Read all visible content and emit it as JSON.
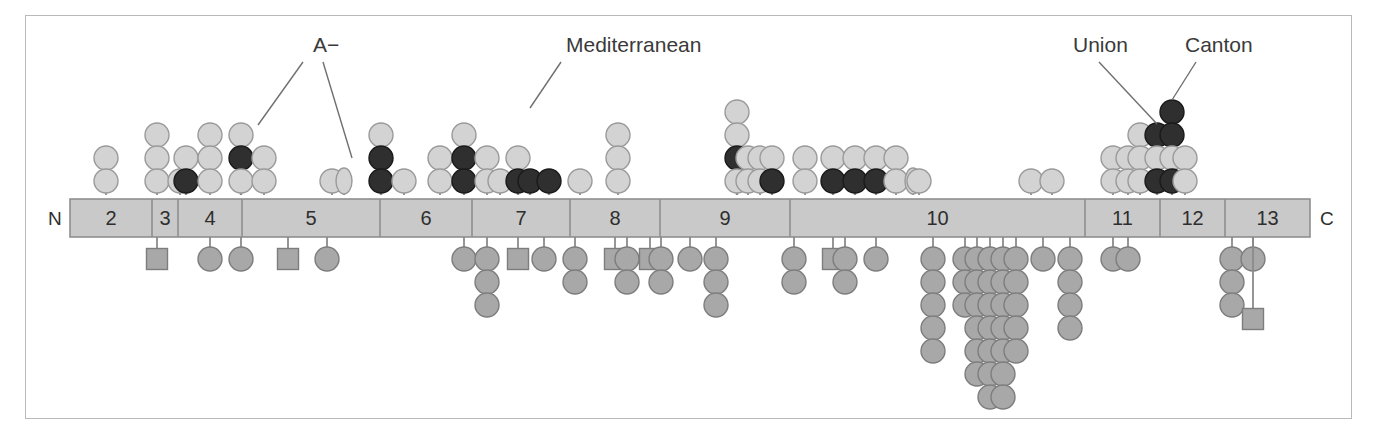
{
  "figure": {
    "terminals": {
      "n_label": "N",
      "c_label": "C"
    },
    "colors": {
      "frame_border": "#b9b9b9",
      "bar_fill": "#c9c9c9",
      "bar_stroke": "#8f8f8f",
      "light_marker_fill": "#d3d3d3",
      "light_marker_stroke": "#9a9a9a",
      "dark_marker_fill": "#2f2f2f",
      "dark_marker_stroke": "#1a1a1a",
      "lower_marker_fill": "#a8a8a8",
      "lower_marker_stroke": "#7d7d7d",
      "stem": "#8b8b8b",
      "text": "#2e2e2e",
      "leader_line": "#6f6f6f"
    },
    "bar": {
      "x": 70,
      "y": 199,
      "width": 1240,
      "height": 38
    },
    "exons": [
      {
        "label": "2",
        "x0": 70,
        "x1": 152
      },
      {
        "label": "3",
        "x0": 152,
        "x1": 178
      },
      {
        "label": "4",
        "x0": 178,
        "x1": 242
      },
      {
        "label": "5",
        "x0": 242,
        "x1": 380
      },
      {
        "label": "6",
        "x0": 380,
        "x1": 472
      },
      {
        "label": "7",
        "x0": 472,
        "x1": 570
      },
      {
        "label": "8",
        "x0": 570,
        "x1": 660
      },
      {
        "label": "9",
        "x0": 660,
        "x1": 790
      },
      {
        "label": "10",
        "x0": 790,
        "x1": 1085
      },
      {
        "label": "11",
        "x0": 1085,
        "x1": 1160
      },
      {
        "label": "12",
        "x0": 1160,
        "x1": 1225
      },
      {
        "label": "13",
        "x0": 1225,
        "x1": 1310
      }
    ],
    "annotations": [
      {
        "name": "A-minus",
        "text": "A−",
        "text_x": 313,
        "text_y": 52,
        "leaders": [
          {
            "x1": 303,
            "y1": 62,
            "x2": 258,
            "y2": 125
          },
          {
            "x1": 323,
            "y1": 62,
            "x2": 352,
            "y2": 158
          }
        ]
      },
      {
        "name": "mediterranean",
        "text": "Mediterranean",
        "text_x": 566,
        "text_y": 52,
        "leaders": [
          {
            "x1": 561,
            "y1": 62,
            "x2": 530,
            "y2": 108
          }
        ]
      },
      {
        "name": "union",
        "text": "Union",
        "text_x": 1073,
        "text_y": 52,
        "leaders": [
          {
            "x1": 1099,
            "y1": 62,
            "x2": 1157,
            "y2": 124
          }
        ]
      },
      {
        "name": "canton",
        "text": "Canton",
        "text_x": 1185,
        "text_y": 52,
        "leaders": [
          {
            "x1": 1196,
            "y1": 62,
            "x2": 1172,
            "y2": 100
          }
        ]
      }
    ],
    "upper_stacks": [
      {
        "x": 106,
        "shape": "circle",
        "colors": [
          "light",
          "light"
        ]
      },
      {
        "x": 157,
        "shape": "circle",
        "colors": [
          "light",
          "light",
          "light"
        ]
      },
      {
        "x": 180,
        "shape": "circle",
        "colors": [
          "light"
        ]
      },
      {
        "x": 186,
        "shape": "circle",
        "colors": [
          "light",
          "dark"
        ]
      },
      {
        "x": 210,
        "shape": "circle",
        "colors": [
          "light",
          "light",
          "light"
        ]
      },
      {
        "x": 241,
        "shape": "circle",
        "colors": [
          "light",
          "dark",
          "light"
        ]
      },
      {
        "x": 264,
        "shape": "circle",
        "colors": [
          "light",
          "light"
        ]
      },
      {
        "x": 332,
        "shape": "circle",
        "colors": [
          "light"
        ]
      },
      {
        "x": 344,
        "shape": "ellipse",
        "colors": [
          "light"
        ]
      },
      {
        "x": 381,
        "shape": "circle",
        "colors": [
          "light",
          "dark",
          "dark"
        ]
      },
      {
        "x": 404,
        "shape": "circle",
        "colors": [
          "light"
        ]
      },
      {
        "x": 440,
        "shape": "circle",
        "colors": [
          "light",
          "light"
        ]
      },
      {
        "x": 464,
        "shape": "circle",
        "colors": [
          "light",
          "dark",
          "dark"
        ]
      },
      {
        "x": 487,
        "shape": "circle",
        "colors": [
          "light",
          "light"
        ]
      },
      {
        "x": 500,
        "shape": "circle",
        "colors": [
          "light"
        ]
      },
      {
        "x": 518,
        "shape": "circle",
        "colors": [
          "light",
          "dark"
        ]
      },
      {
        "x": 530,
        "shape": "circle",
        "colors": [
          "dark"
        ]
      },
      {
        "x": 549,
        "shape": "circle",
        "colors": [
          "dark"
        ]
      },
      {
        "x": 580,
        "shape": "circle",
        "colors": [
          "light"
        ]
      },
      {
        "x": 618,
        "shape": "circle",
        "colors": [
          "light",
          "light",
          "light"
        ]
      },
      {
        "x": 737,
        "shape": "circle",
        "colors": [
          "light",
          "light",
          "dark",
          "light"
        ]
      },
      {
        "x": 748,
        "shape": "circle",
        "colors": [
          "light",
          "light"
        ]
      },
      {
        "x": 760,
        "shape": "circle",
        "colors": [
          "light",
          "light"
        ]
      },
      {
        "x": 772,
        "shape": "circle",
        "colors": [
          "light",
          "dark"
        ]
      },
      {
        "x": 805,
        "shape": "circle",
        "colors": [
          "light",
          "light"
        ]
      },
      {
        "x": 833,
        "shape": "circle",
        "colors": [
          "light",
          "dark"
        ]
      },
      {
        "x": 855,
        "shape": "circle",
        "colors": [
          "light",
          "dark"
        ]
      },
      {
        "x": 876,
        "shape": "circle",
        "colors": [
          "light",
          "dark"
        ]
      },
      {
        "x": 896,
        "shape": "circle",
        "colors": [
          "light",
          "light"
        ]
      },
      {
        "x": 913,
        "shape": "ellipse",
        "colors": [
          "light"
        ]
      },
      {
        "x": 919,
        "shape": "circle",
        "colors": [
          "light"
        ]
      },
      {
        "x": 1031,
        "shape": "circle",
        "colors": [
          "light"
        ]
      },
      {
        "x": 1052,
        "shape": "circle",
        "colors": [
          "light"
        ]
      },
      {
        "x": 1113,
        "shape": "circle",
        "colors": [
          "light",
          "light"
        ]
      },
      {
        "x": 1128,
        "shape": "circle",
        "colors": [
          "light",
          "light"
        ]
      },
      {
        "x": 1140,
        "shape": "circle",
        "colors": [
          "light",
          "light",
          "light"
        ]
      },
      {
        "x": 1157,
        "shape": "circle",
        "colors": [
          "dark",
          "light",
          "dark"
        ]
      },
      {
        "x": 1172,
        "shape": "circle",
        "colors": [
          "dark",
          "dark",
          "light",
          "dark"
        ]
      },
      {
        "x": 1185,
        "shape": "circle",
        "colors": [
          "light",
          "light"
        ]
      }
    ],
    "lower_stacks": [
      {
        "x": 157,
        "count": 1,
        "shapes": [
          "square"
        ]
      },
      {
        "x": 210,
        "count": 1,
        "shapes": [
          "circle"
        ]
      },
      {
        "x": 241,
        "count": 1,
        "shapes": [
          "circle"
        ]
      },
      {
        "x": 288,
        "count": 1,
        "shapes": [
          "square"
        ]
      },
      {
        "x": 327,
        "count": 1,
        "shapes": [
          "circle"
        ]
      },
      {
        "x": 464,
        "count": 1,
        "shapes": [
          "circle"
        ]
      },
      {
        "x": 487,
        "count": 3,
        "shapes": [
          "circle",
          "circle",
          "circle"
        ]
      },
      {
        "x": 518,
        "count": 1,
        "shapes": [
          "square"
        ]
      },
      {
        "x": 544,
        "count": 1,
        "shapes": [
          "circle"
        ]
      },
      {
        "x": 575,
        "count": 2,
        "shapes": [
          "circle",
          "circle"
        ]
      },
      {
        "x": 615,
        "count": 1,
        "shapes": [
          "square"
        ]
      },
      {
        "x": 627,
        "count": 2,
        "shapes": [
          "circle",
          "circle"
        ]
      },
      {
        "x": 650,
        "count": 1,
        "shapes": [
          "square"
        ]
      },
      {
        "x": 661,
        "count": 2,
        "shapes": [
          "circle",
          "circle"
        ]
      },
      {
        "x": 690,
        "count": 1,
        "shapes": [
          "circle"
        ]
      },
      {
        "x": 716,
        "count": 3,
        "shapes": [
          "circle",
          "circle",
          "circle"
        ]
      },
      {
        "x": 794,
        "count": 2,
        "shapes": [
          "circle",
          "circle"
        ]
      },
      {
        "x": 833,
        "count": 1,
        "shapes": [
          "square"
        ]
      },
      {
        "x": 845,
        "count": 2,
        "shapes": [
          "circle",
          "circle"
        ]
      },
      {
        "x": 876,
        "count": 1,
        "shapes": [
          "circle"
        ]
      },
      {
        "x": 933,
        "count": 5,
        "shapes": [
          "circle",
          "circle",
          "circle",
          "circle",
          "circle"
        ]
      },
      {
        "x": 965,
        "count": 3,
        "shapes": [
          "circle",
          "circle",
          "circle"
        ]
      },
      {
        "x": 977,
        "count": 6,
        "shapes": [
          "circle",
          "circle",
          "circle",
          "circle",
          "circle",
          "circle"
        ]
      },
      {
        "x": 990,
        "count": 7,
        "shapes": [
          "circle",
          "circle",
          "circle",
          "circle",
          "circle",
          "circle",
          "circle"
        ]
      },
      {
        "x": 1003,
        "count": 7,
        "shapes": [
          "circle",
          "circle",
          "circle",
          "circle",
          "circle",
          "circle",
          "circle"
        ]
      },
      {
        "x": 1016,
        "count": 5,
        "shapes": [
          "circle",
          "circle",
          "circle",
          "circle",
          "circle"
        ]
      },
      {
        "x": 1043,
        "count": 1,
        "shapes": [
          "circle"
        ]
      },
      {
        "x": 1070,
        "count": 4,
        "shapes": [
          "circle",
          "circle",
          "circle",
          "circle"
        ]
      },
      {
        "x": 1113,
        "count": 1,
        "shapes": [
          "circle"
        ]
      },
      {
        "x": 1128,
        "count": 1,
        "shapes": [
          "circle"
        ]
      },
      {
        "x": 1232,
        "count": 3,
        "shapes": [
          "circle",
          "circle",
          "circle"
        ]
      },
      {
        "x": 1253,
        "count": 1,
        "shapes": [
          "circle"
        ]
      },
      {
        "x": 1253,
        "count": 1,
        "shapes": [
          "square"
        ],
        "deep": true
      }
    ]
  }
}
